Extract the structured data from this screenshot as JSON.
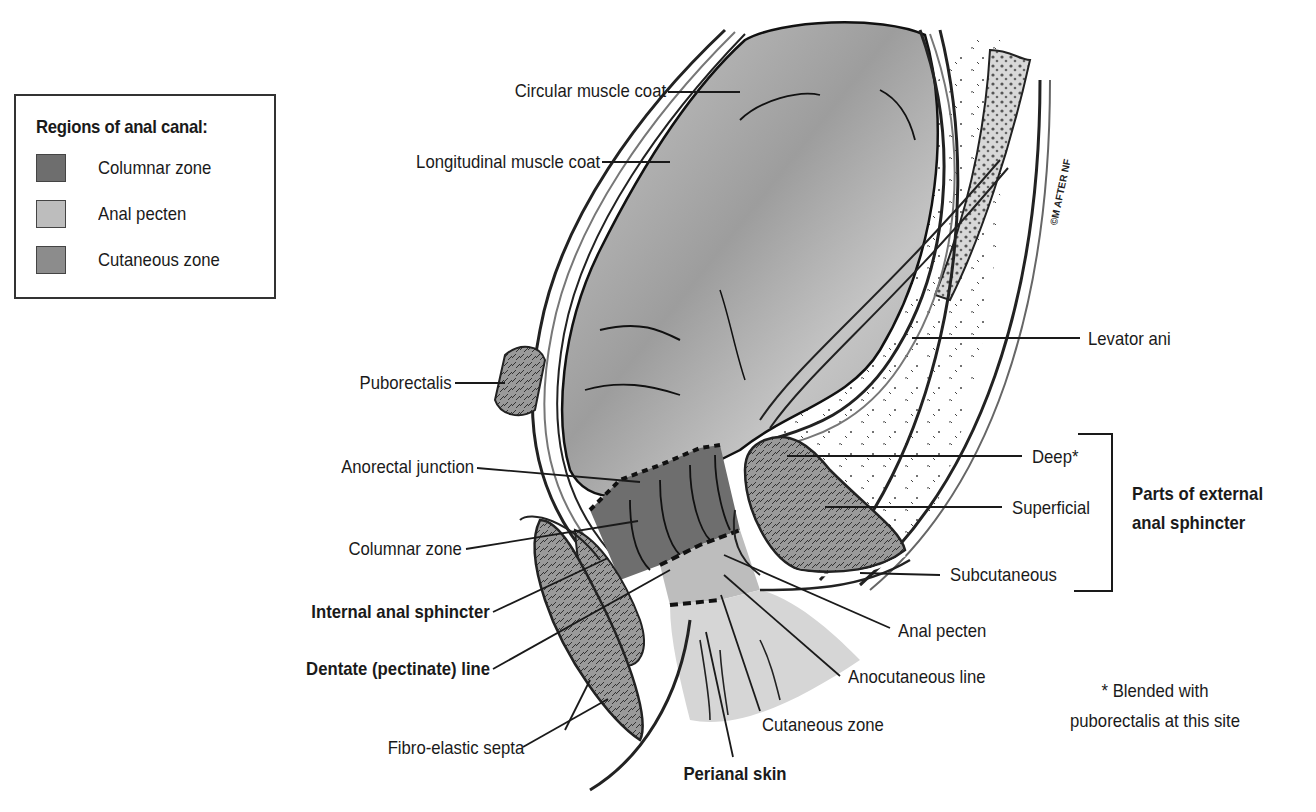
{
  "legend": {
    "title": "Regions of anal canal:",
    "items": [
      {
        "label": "Columnar zone",
        "color": "#6e6e6e"
      },
      {
        "label": "Anal pecten",
        "color": "#bdbdbd"
      },
      {
        "label": "Cutaneous zone",
        "color": "#8c8c8c"
      }
    ]
  },
  "labels": {
    "circular_muscle_coat": "Circular muscle coat",
    "longitudinal_muscle_coat": "Longitudinal muscle coat",
    "puborectalis": "Puborectalis",
    "anorectal_junction": "Anorectal junction",
    "columnar_zone": "Columnar zone",
    "internal_anal_sphincter": "Internal anal sphincter",
    "dentate_line": "Dentate (pectinate) line",
    "fibro_elastic_septa": "Fibro-elastic septa",
    "perianal_skin": "Perianal skin",
    "cutaneous_zone": "Cutaneous zone",
    "anocutaneous_line": "Anocutaneous line",
    "anal_pecten": "Anal pecten",
    "levator_ani": "Levator ani",
    "deep": "Deep*",
    "superficial": "Superficial",
    "subcutaneous": "Subcutaneous",
    "external_sphincter_group_line1": "Parts of external",
    "external_sphincter_group_line2": "anal sphincter",
    "footnote_line1": "* Blended with",
    "footnote_line2": "puborectalis at this site"
  },
  "artist_signature": "©M AFTER NF"
}
